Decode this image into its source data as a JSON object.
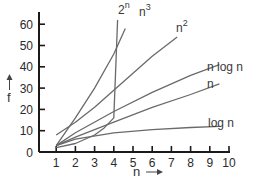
{
  "chart_data": {
    "type": "line",
    "title": "",
    "xlabel": "n",
    "ylabel": "f",
    "xlim": [
      0,
      10
    ],
    "ylim": [
      0,
      65
    ],
    "x_ticks": [
      "1",
      "2",
      "3",
      "4",
      "5",
      "6",
      "7",
      "8",
      "9",
      "10"
    ],
    "y_ticks": [
      "0",
      "10",
      "20",
      "30",
      "40",
      "50",
      "60"
    ],
    "origin_label": "0",
    "grid": false,
    "legend": "inline labels at curve ends",
    "series": [
      {
        "name": "2^n",
        "label_base": "2",
        "label_sup": "n",
        "x": [
          1,
          2,
          3,
          3.5,
          4,
          4.2
        ],
        "values": [
          2,
          4,
          8,
          11.3,
          16,
          62
        ]
      },
      {
        "name": "n^3",
        "label_base": "n",
        "label_sup": "3",
        "x": [
          1,
          2,
          3,
          4,
          4.6
        ],
        "values": [
          3,
          16,
          30,
          46,
          58
        ]
      },
      {
        "name": "n^2",
        "label_base": "n",
        "label_sup": "2",
        "x": [
          1,
          2,
          3,
          4,
          5,
          6,
          7.3
        ],
        "values": [
          8,
          14,
          21,
          29,
          37,
          45,
          54
        ]
      },
      {
        "name": "n log n",
        "label_base": "n log n",
        "label_sup": "",
        "x": [
          1,
          2,
          4,
          6,
          8,
          9.5
        ],
        "values": [
          3,
          9,
          19,
          28,
          36,
          41
        ]
      },
      {
        "name": "n",
        "label_base": "n",
        "label_sup": "",
        "x": [
          1,
          2,
          4,
          6,
          8,
          9.5
        ],
        "values": [
          3,
          7,
          14,
          21,
          27,
          32
        ]
      },
      {
        "name": "log n",
        "label_base": "log n",
        "label_sup": "",
        "x": [
          1,
          2,
          4,
          6,
          8,
          9.5
        ],
        "values": [
          3,
          6,
          9,
          10.5,
          11.5,
          12
        ]
      }
    ]
  },
  "axes": {
    "x_title": "n",
    "y_title": "f",
    "x_arrow": "→",
    "y_arrow": "↑"
  },
  "colors": {
    "axis": "#1a1a1a",
    "curve": "#6a6a6a",
    "text": "#2a2a2a"
  }
}
